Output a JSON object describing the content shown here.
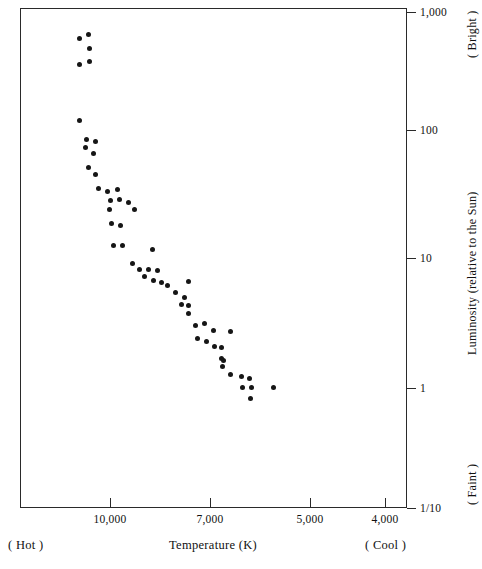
{
  "chart_data": {
    "type": "scatter",
    "title": "",
    "xlabel": "Temperature (K)",
    "ylabel": "Luminosity (relative to the Sun)",
    "xscale": "linear-reversed",
    "yscale": "log",
    "xlim": [
      11250,
      3625
    ],
    "ylim": [
      0.1,
      1000
    ],
    "grid": false,
    "legend": null,
    "x_ticks": [
      {
        "value": 10000,
        "label": "10,000",
        "px": 110
      },
      {
        "value": 7000,
        "label": "7,000",
        "px": 210
      },
      {
        "value": 5000,
        "label": "5,000",
        "px": 310
      },
      {
        "value": 4000,
        "label": "4,000",
        "px": 385
      }
    ],
    "y_ticks": [
      {
        "value": 1000,
        "label": "1,000",
        "px": 12
      },
      {
        "value": 100,
        "label": "100",
        "px": 130
      },
      {
        "value": 10,
        "label": "10",
        "px": 258
      },
      {
        "value": 1,
        "label": "1",
        "px": 388
      },
      {
        "value": 0.1,
        "label": "1/10",
        "px": 508
      }
    ],
    "annotations": {
      "x_left": "( Hot )",
      "x_right": "( Cool )",
      "y_top": "( Bright )",
      "y_bottom": "( Faint )"
    },
    "points": [
      {
        "x": 11000,
        "y": 620,
        "px": 78,
        "py": 37
      },
      {
        "x": 10700,
        "y": 700,
        "px": 87,
        "py": 33
      },
      {
        "x": 10650,
        "y": 520,
        "px": 88,
        "py": 47
      },
      {
        "x": 10600,
        "y": 400,
        "px": 88,
        "py": 60
      },
      {
        "x": 11000,
        "y": 380,
        "px": 78,
        "py": 63
      },
      {
        "x": 11000,
        "y": 150,
        "px": 78,
        "py": 119
      },
      {
        "x": 10800,
        "y": 95,
        "px": 85,
        "py": 138
      },
      {
        "x": 10500,
        "y": 92,
        "px": 94,
        "py": 140
      },
      {
        "x": 10820,
        "y": 82,
        "px": 84,
        "py": 146
      },
      {
        "x": 10560,
        "y": 72,
        "px": 92,
        "py": 152
      },
      {
        "x": 10740,
        "y": 52,
        "px": 87,
        "py": 166
      },
      {
        "x": 10500,
        "y": 44,
        "px": 94,
        "py": 173
      },
      {
        "x": 10400,
        "y": 34,
        "px": 97,
        "py": 187
      },
      {
        "x": 10100,
        "y": 32,
        "px": 106,
        "py": 190
      },
      {
        "x": 9750,
        "y": 34,
        "px": 116,
        "py": 188
      },
      {
        "x": 10000,
        "y": 27,
        "px": 109,
        "py": 199
      },
      {
        "x": 9680,
        "y": 28,
        "px": 118,
        "py": 198
      },
      {
        "x": 9350,
        "y": 26,
        "px": 127,
        "py": 201
      },
      {
        "x": 10030,
        "y": 23,
        "px": 108,
        "py": 208
      },
      {
        "x": 9120,
        "y": 23,
        "px": 133,
        "py": 208
      },
      {
        "x": 9960,
        "y": 16,
        "px": 110,
        "py": 222
      },
      {
        "x": 9630,
        "y": 15,
        "px": 119,
        "py": 224
      },
      {
        "x": 9700,
        "y": 12,
        "px": 112,
        "py": 244
      },
      {
        "x": 9400,
        "y": 12,
        "px": 121,
        "py": 244
      },
      {
        "x": 8320,
        "y": 11,
        "px": 151,
        "py": 248
      },
      {
        "x": 8900,
        "y": 8.4,
        "px": 131,
        "py": 262
      },
      {
        "x": 8650,
        "y": 7.3,
        "px": 138,
        "py": 268
      },
      {
        "x": 8330,
        "y": 7.3,
        "px": 147,
        "py": 268
      },
      {
        "x": 8010,
        "y": 7.1,
        "px": 156,
        "py": 269
      },
      {
        "x": 8470,
        "y": 6.1,
        "px": 143,
        "py": 275
      },
      {
        "x": 8150,
        "y": 5.5,
        "px": 152,
        "py": 279
      },
      {
        "x": 7860,
        "y": 5.2,
        "px": 160,
        "py": 281
      },
      {
        "x": 7650,
        "y": 4.8,
        "px": 166,
        "py": 284
      },
      {
        "x": 6900,
        "y": 5.5,
        "px": 187,
        "py": 280
      },
      {
        "x": 7250,
        "y": 4.1,
        "px": 174,
        "py": 291
      },
      {
        "x": 6930,
        "y": 3.6,
        "px": 183,
        "py": 296
      },
      {
        "x": 6790,
        "y": 3.1,
        "px": 187,
        "py": 304
      },
      {
        "x": 7040,
        "y": 3.2,
        "px": 180,
        "py": 303
      },
      {
        "x": 6790,
        "y": 2.6,
        "px": 187,
        "py": 312
      },
      {
        "x": 6540,
        "y": 2.1,
        "px": 194,
        "py": 324
      },
      {
        "x": 6220,
        "y": 2.2,
        "px": 203,
        "py": 322
      },
      {
        "x": 5900,
        "y": 1.8,
        "px": 212,
        "py": 329
      },
      {
        "x": 5290,
        "y": 1.8,
        "px": 229,
        "py": 330
      },
      {
        "x": 6470,
        "y": 1.7,
        "px": 196,
        "py": 337
      },
      {
        "x": 6150,
        "y": 1.6,
        "px": 205,
        "py": 340
      },
      {
        "x": 5870,
        "y": 1.4,
        "px": 213,
        "py": 345
      },
      {
        "x": 5620,
        "y": 1.4,
        "px": 220,
        "py": 346
      },
      {
        "x": 5550,
        "y": 1.2,
        "px": 222,
        "py": 359
      },
      {
        "x": 5620,
        "y": 1.25,
        "px": 220,
        "py": 357
      },
      {
        "x": 5580,
        "y": 1.15,
        "px": 221,
        "py": 365
      },
      {
        "x": 5290,
        "y": 1.1,
        "px": 229,
        "py": 373
      },
      {
        "x": 4900,
        "y": 1.05,
        "px": 240,
        "py": 375
      },
      {
        "x": 4610,
        "y": 1.03,
        "px": 248,
        "py": 377
      },
      {
        "x": 4860,
        "y": 0.98,
        "px": 241,
        "py": 386
      },
      {
        "x": 4540,
        "y": 0.98,
        "px": 250,
        "py": 386
      },
      {
        "x": 4290,
        "y": 0.98,
        "px": 272,
        "py": 386
      },
      {
        "x": 4570,
        "y": 0.93,
        "px": 249,
        "py": 397
      }
    ]
  }
}
